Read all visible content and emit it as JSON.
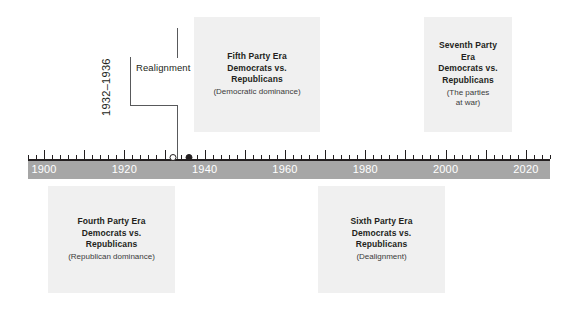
{
  "figure": {
    "kind": "timeline",
    "background_color": "#ffffff",
    "bar_color": "#a6a6a6",
    "panel_color": "#f0f0f0",
    "ink_color": "#231f20",
    "year_label_color": "#ffffff"
  },
  "axis": {
    "start_year": 1896,
    "end_year": 2026,
    "tick_interval_years": 2,
    "major_tick_interval_years": 10,
    "year_labels": [
      {
        "year": 1900,
        "text": "1900"
      },
      {
        "year": 1920,
        "text": "1920"
      },
      {
        "year": 1940,
        "text": "1940"
      },
      {
        "year": 1960,
        "text": "1960"
      },
      {
        "year": 1980,
        "text": "1980"
      },
      {
        "year": 2000,
        "text": "2000"
      },
      {
        "year": 2020,
        "text": "2020"
      }
    ]
  },
  "realignment": {
    "years_text": "1932–1936",
    "label": "Realignment",
    "start_year": 1932,
    "end_year": 1936,
    "markers": [
      {
        "year": 1932,
        "style": "hollow"
      },
      {
        "year": 1936,
        "style": "filled"
      }
    ]
  },
  "eras": [
    {
      "id": "fourth",
      "title": "Fourth Party Era\nDemocrats vs.\nRepublicans",
      "subtitle": "(Republican dominance)",
      "position": "below"
    },
    {
      "id": "fifth",
      "title": "Fifth Party Era\nDemocrats vs.\nRepublicans",
      "subtitle": "(Democratic dominance)",
      "position": "above"
    },
    {
      "id": "sixth",
      "title": "Sixth Party Era\nDemocrats vs.\nRepublicans",
      "subtitle": "(Dealignment)",
      "position": "below"
    },
    {
      "id": "seventh",
      "title": "Seventh Party\nEra\nDemocrats vs.\nRepublicans",
      "subtitle": "(The parties\nat war)",
      "position": "above"
    }
  ],
  "chart_data": {
    "type": "timeline",
    "title": "",
    "xlabel": "",
    "ylabel": "",
    "xlim": [
      1896,
      2026
    ],
    "grid": false,
    "legend": "none",
    "axis_tick_labels": [
      "1900",
      "1920",
      "1940",
      "1960",
      "1980",
      "2000",
      "2020"
    ],
    "annotations": [
      {
        "text": "1932–1936",
        "year": 1932
      },
      {
        "text": "Realignment",
        "year": 1934
      }
    ],
    "events": [
      {
        "label": "1932",
        "year": 1932,
        "marker": "open-circle"
      },
      {
        "label": "1936",
        "year": 1936,
        "marker": "filled-circle"
      }
    ],
    "spans": [
      {
        "name": "Fourth Party Era",
        "detail": "Democrats vs. Republicans",
        "note": "(Republican dominance)",
        "side": "below"
      },
      {
        "name": "Fifth Party Era",
        "detail": "Democrats vs. Republicans",
        "note": "(Democratic dominance)",
        "side": "above"
      },
      {
        "name": "Sixth Party Era",
        "detail": "Democrats vs. Republicans",
        "note": "(Dealignment)",
        "side": "below"
      },
      {
        "name": "Seventh Party Era",
        "detail": "Democrats vs. Republicans",
        "note": "(The parties at war)",
        "side": "above"
      }
    ]
  }
}
